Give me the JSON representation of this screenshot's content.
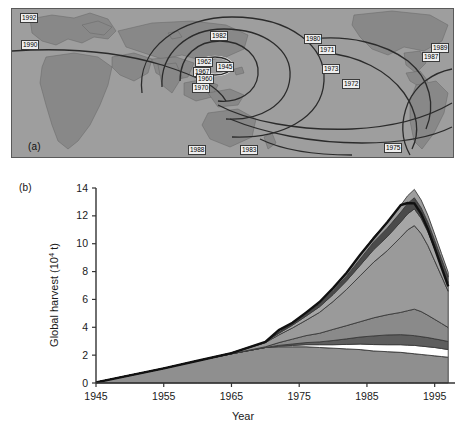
{
  "figure": {
    "panel_a_tag": "(a)",
    "panel_b_tag": "(b)"
  },
  "map": {
    "description": "World map showing spread of the seventh cholera pandemic with contour fronts and year labels",
    "year_labels": [
      {
        "year": "1992",
        "x": 8,
        "y": 4
      },
      {
        "year": "1990",
        "x": 9,
        "y": 31
      },
      {
        "year": "1982",
        "x": 198,
        "y": 22
      },
      {
        "year": "1980",
        "x": 292,
        "y": 25
      },
      {
        "year": "1971",
        "x": 306,
        "y": 36
      },
      {
        "year": "1989",
        "x": 419,
        "y": 34
      },
      {
        "year": "1987",
        "x": 410,
        "y": 43
      },
      {
        "year": "1973",
        "x": 310,
        "y": 55
      },
      {
        "year": "1972",
        "x": 330,
        "y": 70
      },
      {
        "year": "1962",
        "x": 183,
        "y": 48
      },
      {
        "year": "1945",
        "x": 204,
        "y": 53
      },
      {
        "year": "1967",
        "x": 181,
        "y": 58
      },
      {
        "year": "1960",
        "x": 184,
        "y": 65
      },
      {
        "year": "1970",
        "x": 180,
        "y": 74
      },
      {
        "year": "1988",
        "x": 176,
        "y": 141
      },
      {
        "year": "1983",
        "x": 228,
        "y": 141
      },
      {
        "year": "1975",
        "x": 372,
        "y": 139
      }
    ],
    "palette": {
      "ocean": "#9e9e9e",
      "land": "#8a8a8a",
      "route": "#2b2b2b",
      "pill_bg": "#efefef"
    }
  },
  "chart_data": {
    "type": "area",
    "stacked": true,
    "title": "",
    "xlabel": "Year",
    "ylabel": "Global harvest (10⁴ t)",
    "ylabel_main": "Global harvest (10",
    "ylabel_exp": "4",
    "ylabel_tail": " t)",
    "xlim": [
      1945,
      1998
    ],
    "ylim": [
      0,
      14
    ],
    "grid": false,
    "legend": "none",
    "xticks": [
      1945,
      1955,
      1965,
      1975,
      1985,
      1995
    ],
    "xtick_labels": [
      "1945",
      "1955",
      "1965",
      "1975",
      "1985",
      "1995"
    ],
    "yticks": [
      0,
      2,
      4,
      6,
      8,
      10,
      12,
      14
    ],
    "ytick_labels": [
      "0",
      "2",
      "4",
      "6",
      "8",
      "10",
      "12",
      "14"
    ],
    "x": [
      1945,
      1950,
      1955,
      1960,
      1965,
      1970,
      1972,
      1974,
      1976,
      1978,
      1980,
      1982,
      1984,
      1986,
      1988,
      1990,
      1991,
      1992,
      1993,
      1994,
      1995,
      1996,
      1997
    ],
    "series": [
      {
        "name": "layer-1-base",
        "color": "#8f8f8f",
        "values": [
          0.05,
          0.55,
          1.05,
          1.6,
          2.1,
          2.55,
          2.6,
          2.6,
          2.6,
          2.55,
          2.5,
          2.45,
          2.4,
          2.3,
          2.25,
          2.2,
          2.15,
          2.1,
          2.05,
          2.0,
          1.95,
          1.9,
          1.85
        ]
      },
      {
        "name": "layer-2-white-gap",
        "color": "#ffffff",
        "values": [
          0.0,
          0.0,
          0.0,
          0.0,
          0.0,
          0.0,
          0.05,
          0.1,
          0.15,
          0.2,
          0.25,
          0.32,
          0.4,
          0.46,
          0.5,
          0.55,
          0.57,
          0.6,
          0.6,
          0.6,
          0.6,
          0.58,
          0.55
        ]
      },
      {
        "name": "layer-3-dark-band",
        "color": "#5e5e5e",
        "values": [
          0.0,
          0.0,
          0.0,
          0.0,
          0.0,
          0.0,
          0.05,
          0.1,
          0.15,
          0.2,
          0.3,
          0.4,
          0.5,
          0.62,
          0.7,
          0.72,
          0.72,
          0.7,
          0.68,
          0.66,
          0.62,
          0.6,
          0.58
        ]
      },
      {
        "name": "layer-4-mid-grey",
        "color": "#8a8a8a",
        "values": [
          0.0,
          0.0,
          0.0,
          0.0,
          0.0,
          0.05,
          0.2,
          0.35,
          0.5,
          0.62,
          0.8,
          0.95,
          1.1,
          1.3,
          1.45,
          1.6,
          1.75,
          1.9,
          1.8,
          1.6,
          1.4,
          1.2,
          1.0
        ]
      },
      {
        "name": "layer-5-broad-grey",
        "color": "#9a9a9a",
        "values": [
          0.0,
          0.0,
          0.0,
          0.0,
          0.05,
          0.3,
          0.55,
          0.8,
          1.1,
          1.5,
          2.0,
          2.6,
          3.3,
          4.0,
          4.6,
          5.4,
          5.8,
          6.0,
          5.6,
          5.0,
          4.2,
          3.4,
          2.6
        ]
      },
      {
        "name": "layer-6-light-grey",
        "color": "#a6a6a6",
        "values": [
          0.0,
          0.0,
          0.0,
          0.0,
          0.0,
          0.05,
          0.12,
          0.2,
          0.3,
          0.4,
          0.5,
          0.62,
          0.75,
          0.9,
          1.0,
          1.1,
          1.15,
          1.2,
          1.1,
          1.0,
          0.88,
          0.75,
          0.62
        ]
      },
      {
        "name": "layer-7-charcoal",
        "color": "#4a4a4a",
        "values": [
          0.0,
          0.0,
          0.0,
          0.0,
          0.0,
          0.0,
          0.05,
          0.1,
          0.15,
          0.2,
          0.28,
          0.35,
          0.45,
          0.55,
          0.62,
          0.7,
          0.75,
          0.8,
          0.75,
          0.68,
          0.6,
          0.5,
          0.42
        ]
      },
      {
        "name": "layer-8-top-grey",
        "color": "#9e9e9e",
        "values": [
          0.0,
          0.0,
          0.0,
          0.0,
          0.0,
          0.0,
          0.03,
          0.07,
          0.1,
          0.14,
          0.18,
          0.23,
          0.3,
          0.36,
          0.42,
          0.5,
          0.55,
          0.6,
          0.56,
          0.5,
          0.44,
          0.38,
          0.32
        ]
      }
    ],
    "total_values": [
      0.05,
      0.55,
      1.05,
      1.6,
      2.15,
      2.95,
      3.8,
      4.32,
      5.05,
      5.81,
      6.81,
      7.92,
      9.2,
      10.39,
      11.54,
      12.77,
      12.92,
      12.9,
      12.14,
      11.04,
      9.69,
      8.31,
      6.94
    ],
    "peak": {
      "year": 1991,
      "value": 12.9
    }
  }
}
